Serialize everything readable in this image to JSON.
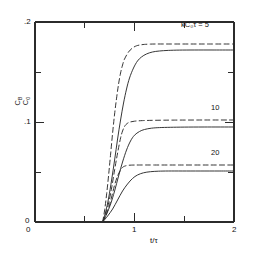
{
  "chart_data": {
    "type": "line",
    "title": "",
    "xlabel": "t/τ",
    "ylabel": "C_B/C_0",
    "ylabel_numerator": "C",
    "ylabel_numerator_sub": "B",
    "ylabel_denominator": "C",
    "ylabel_denominator_sub": "0",
    "xlim": [
      0,
      2
    ],
    "ylim": [
      0,
      0.2
    ],
    "xticks": [
      0,
      0.5,
      1,
      1.5,
      2
    ],
    "xticklabels": [
      "0",
      "",
      "1",
      "",
      "2"
    ],
    "yticks": [
      0,
      0.05,
      0.1,
      0.15,
      0.2
    ],
    "yticklabels": [
      "0",
      "",
      ".1",
      "",
      ".2"
    ],
    "grid": false,
    "legend": "inline-annotations",
    "breakthrough_x": 0.68,
    "annotations": [
      {
        "text": "kC₀τ = 5",
        "x": 1.62,
        "y": 0.188,
        "series": "dashed-5"
      },
      {
        "text": "10",
        "x": 1.79,
        "y": 0.111,
        "series": "dashed-10"
      },
      {
        "text": "20",
        "x": 1.79,
        "y": 0.066,
        "series": "dashed-20"
      }
    ],
    "series": [
      {
        "name": "kC0tau = 5 (dashed)",
        "style": "dashed",
        "plateau": 0.178,
        "label": "kC₀τ = 5",
        "x": [
          0.68,
          0.7,
          0.72,
          0.74,
          0.76,
          0.78,
          0.8,
          0.82,
          0.84,
          0.86,
          0.88,
          0.9,
          0.94,
          0.98,
          1.02,
          1.06,
          1.1,
          1.16,
          1.22,
          1.3,
          1.4,
          1.55,
          1.75,
          2.0
        ],
        "y": [
          0.0,
          0.012,
          0.028,
          0.047,
          0.068,
          0.089,
          0.108,
          0.124,
          0.138,
          0.149,
          0.157,
          0.163,
          0.17,
          0.174,
          0.1762,
          0.1771,
          0.1776,
          0.1779,
          0.178,
          0.178,
          0.178,
          0.178,
          0.178,
          0.178
        ]
      },
      {
        "name": "kC0tau = 5 (solid)",
        "style": "solid",
        "plateau": 0.172,
        "x": [
          0.68,
          0.71,
          0.74,
          0.77,
          0.8,
          0.83,
          0.86,
          0.89,
          0.92,
          0.95,
          0.99,
          1.03,
          1.07,
          1.12,
          1.18,
          1.25,
          1.34,
          1.45,
          1.6,
          1.8,
          2.0
        ],
        "y": [
          0.0,
          0.01,
          0.024,
          0.042,
          0.062,
          0.083,
          0.102,
          0.119,
          0.133,
          0.144,
          0.154,
          0.161,
          0.165,
          0.168,
          0.17,
          0.171,
          0.1716,
          0.1719,
          0.172,
          0.172,
          0.172
        ]
      },
      {
        "name": "kC0tau = 10 (dashed)",
        "style": "dashed",
        "plateau": 0.102,
        "label": "10",
        "x": [
          0.68,
          0.71,
          0.74,
          0.77,
          0.8,
          0.83,
          0.86,
          0.88,
          0.9,
          0.92,
          0.95,
          1.0,
          1.08,
          1.2,
          1.4,
          1.7,
          2.0
        ],
        "y": [
          0.0,
          0.008,
          0.019,
          0.034,
          0.052,
          0.069,
          0.084,
          0.091,
          0.0955,
          0.098,
          0.0998,
          0.1008,
          0.1014,
          0.1017,
          0.1019,
          0.102,
          0.102
        ]
      },
      {
        "name": "kC0tau = 10 (solid)",
        "style": "solid",
        "plateau": 0.095,
        "x": [
          0.68,
          0.72,
          0.76,
          0.8,
          0.84,
          0.88,
          0.92,
          0.96,
          1.0,
          1.05,
          1.1,
          1.17,
          1.25,
          1.36,
          1.5,
          1.7,
          2.0
        ],
        "y": [
          0.0,
          0.008,
          0.018,
          0.031,
          0.046,
          0.06,
          0.072,
          0.081,
          0.0868,
          0.0905,
          0.0925,
          0.0938,
          0.0944,
          0.0947,
          0.0949,
          0.095,
          0.095
        ]
      },
      {
        "name": "kC0tau = 20 (dashed)",
        "style": "dashed",
        "plateau": 0.057,
        "label": "20",
        "x": [
          0.68,
          0.71,
          0.74,
          0.77,
          0.8,
          0.83,
          0.86,
          0.88,
          0.9,
          0.93,
          0.97,
          1.05,
          1.2,
          1.45,
          1.75,
          2.0
        ],
        "y": [
          0.0,
          0.006,
          0.014,
          0.025,
          0.037,
          0.046,
          0.052,
          0.0546,
          0.0558,
          0.0566,
          0.0569,
          0.057,
          0.057,
          0.057,
          0.057,
          0.057
        ]
      },
      {
        "name": "kC0tau = 20 (solid)",
        "style": "solid",
        "plateau": 0.051,
        "x": [
          0.68,
          0.73,
          0.78,
          0.83,
          0.88,
          0.93,
          0.98,
          1.03,
          1.09,
          1.16,
          1.24,
          1.34,
          1.48,
          1.66,
          1.85,
          2.0
        ],
        "y": [
          0.0,
          0.006,
          0.013,
          0.022,
          0.031,
          0.038,
          0.0435,
          0.047,
          0.0492,
          0.0503,
          0.0508,
          0.051,
          0.051,
          0.051,
          0.051,
          0.051
        ]
      }
    ]
  },
  "axes": {
    "x_tick_0": "0",
    "x_tick_1": "1",
    "x_tick_2": "2",
    "y_tick_0": "0",
    "y_tick_1": ".1",
    "y_tick_2": ".2",
    "x_axis_label": "t/τ"
  },
  "curve_labels": {
    "top": "kC₀τ = 5",
    "middle": "10",
    "bottom": "20"
  }
}
